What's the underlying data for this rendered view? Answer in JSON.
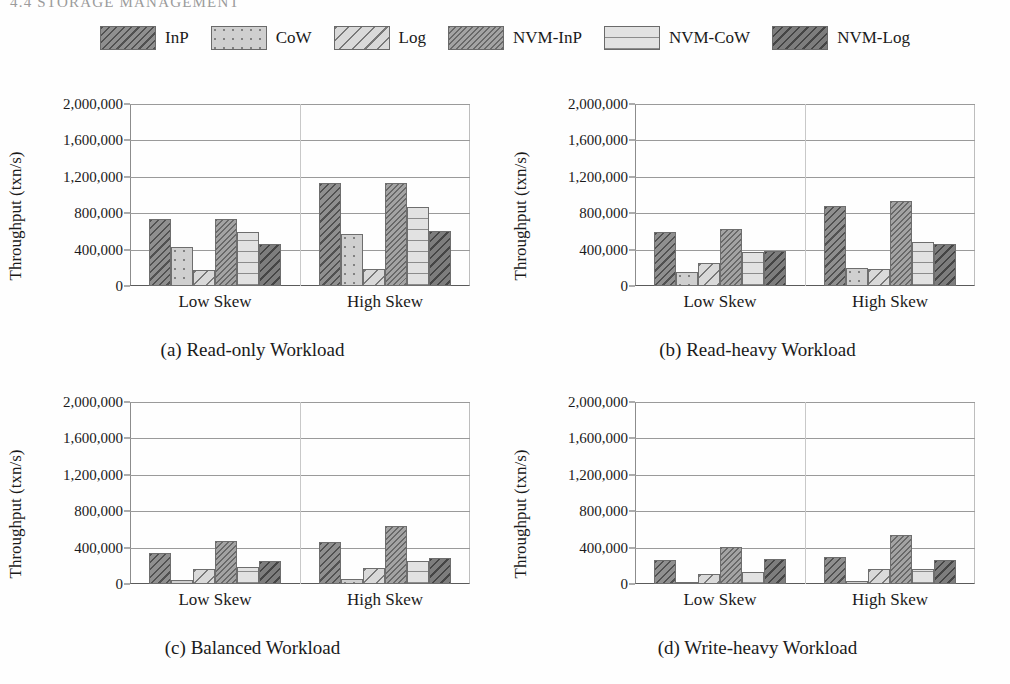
{
  "running_header": "4.4 STORAGE MANAGEMENT",
  "legend": {
    "items": [
      {
        "label": "InP",
        "pattern": "p-inp",
        "icon": "legend-swatch-inp"
      },
      {
        "label": "CoW",
        "pattern": "p-cow",
        "icon": "legend-swatch-cow"
      },
      {
        "label": "Log",
        "pattern": "p-log",
        "icon": "legend-swatch-log"
      },
      {
        "label": "NVM-InP",
        "pattern": "p-nvminp",
        "icon": "legend-swatch-nvm-inp"
      },
      {
        "label": "NVM-CoW",
        "pattern": "p-nvmcow",
        "icon": "legend-swatch-nvm-cow"
      },
      {
        "label": "NVM-Log",
        "pattern": "p-nvmlog",
        "icon": "legend-swatch-nvm-log"
      }
    ]
  },
  "axis": {
    "ylabel": "Throughput (txn/s)",
    "yticks": [
      0,
      400000,
      800000,
      1200000,
      1600000,
      2000000
    ],
    "ytick_labels": [
      "0",
      "400,000",
      "800,000",
      "1,200,000",
      "1,600,000",
      "2,000,000"
    ],
    "ylim": [
      0,
      2000000
    ],
    "categories": [
      "Low Skew",
      "High Skew"
    ],
    "grid": true
  },
  "chart_data": [
    {
      "id": "a",
      "type": "bar",
      "title": "(a) Read-only Workload",
      "xlabel": "",
      "ylabel": "Throughput (txn/s)",
      "ylim": [
        0,
        2000000
      ],
      "categories": [
        "Low Skew",
        "High Skew"
      ],
      "series": [
        {
          "name": "InP",
          "values": [
            740000,
            1130000
          ]
        },
        {
          "name": "CoW",
          "values": [
            430000,
            570000
          ]
        },
        {
          "name": "Log",
          "values": [
            175000,
            190000
          ]
        },
        {
          "name": "NVM-InP",
          "values": [
            740000,
            1130000
          ]
        },
        {
          "name": "NVM-CoW",
          "values": [
            595000,
            865000
          ]
        },
        {
          "name": "NVM-Log",
          "values": [
            465000,
            600000
          ]
        }
      ]
    },
    {
      "id": "b",
      "type": "bar",
      "title": "(b) Read-heavy Workload",
      "xlabel": "",
      "ylabel": "Throughput (txn/s)",
      "ylim": [
        0,
        2000000
      ],
      "categories": [
        "Low Skew",
        "High Skew"
      ],
      "series": [
        {
          "name": "InP",
          "values": [
            590000,
            880000
          ]
        },
        {
          "name": "CoW",
          "values": [
            155000,
            200000
          ]
        },
        {
          "name": "Log",
          "values": [
            250000,
            185000
          ]
        },
        {
          "name": "NVM-InP",
          "values": [
            630000,
            930000
          ]
        },
        {
          "name": "NVM-CoW",
          "values": [
            375000,
            485000
          ]
        },
        {
          "name": "NVM-Log",
          "values": [
            380000,
            460000
          ]
        }
      ]
    },
    {
      "id": "c",
      "type": "bar",
      "title": "(c) Balanced Workload",
      "xlabel": "",
      "ylabel": "Throughput (txn/s)",
      "ylim": [
        0,
        2000000
      ],
      "categories": [
        "Low Skew",
        "High Skew"
      ],
      "series": [
        {
          "name": "InP",
          "values": [
            345000,
            460000
          ]
        },
        {
          "name": "CoW",
          "values": [
            45000,
            60000
          ]
        },
        {
          "name": "Log",
          "values": [
            160000,
            180000
          ]
        },
        {
          "name": "NVM-InP",
          "values": [
            475000,
            640000
          ]
        },
        {
          "name": "NVM-CoW",
          "values": [
            190000,
            255000
          ]
        },
        {
          "name": "NVM-Log",
          "values": [
            250000,
            285000
          ]
        }
      ]
    },
    {
      "id": "d",
      "type": "bar",
      "title": "(d) Write-heavy Workload",
      "xlabel": "",
      "ylabel": "Throughput (txn/s)",
      "ylim": [
        0,
        2000000
      ],
      "categories": [
        "Low Skew",
        "High Skew"
      ],
      "series": [
        {
          "name": "InP",
          "values": [
            265000,
            300000
          ]
        },
        {
          "name": "CoW",
          "values": [
            20000,
            30000
          ]
        },
        {
          "name": "Log",
          "values": [
            115000,
            160000
          ]
        },
        {
          "name": "NVM-InP",
          "values": [
            405000,
            540000
          ]
        },
        {
          "name": "NVM-CoW",
          "values": [
            135000,
            165000
          ]
        },
        {
          "name": "NVM-Log",
          "values": [
            270000,
            265000
          ]
        }
      ]
    }
  ]
}
